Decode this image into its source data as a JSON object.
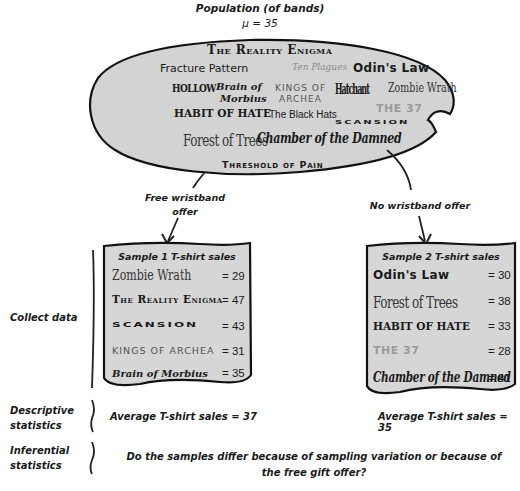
{
  "population": {
    "title": "Population (of bands)",
    "mean_label": "μ = 35",
    "bands": [
      "The Reality Enigma",
      "Fracture Pattern",
      "Ten Plagues",
      "Odin's Law",
      "HOLLOW",
      "Brain of",
      "Morbius",
      "KINGS OF",
      "ARCHEA",
      "Hatchant",
      "Zombie Wrath",
      "THE 37",
      "HABIT OF HATE",
      "The Black Hats",
      "SCANSION",
      "Forest of Trees",
      "Chamber of the Damned",
      "Threshold of Pain"
    ]
  },
  "branches": {
    "left_label": "Free wristband offer",
    "left_label_line1": "Free wristband",
    "left_label_line2": "offer",
    "right_label": "No wristband offer"
  },
  "samples": [
    {
      "title": "Sample 1 T-shirt sales",
      "rows": [
        {
          "band": "Zombie Wrath",
          "value": "= 29"
        },
        {
          "band": "The Reality Enigma",
          "value": "= 47"
        },
        {
          "band": "SCANSION",
          "value": "= 43"
        },
        {
          "band": "KINGS OF ARCHEA",
          "value": "= 31"
        },
        {
          "band": "Brain of Morbius",
          "value": "= 35"
        }
      ],
      "average": "Average T-shirt sales = 37"
    },
    {
      "title": "Sample 2 T-shirt sales",
      "rows": [
        {
          "band": "Odin's Law",
          "value": "= 30"
        },
        {
          "band": "Forest of Trees",
          "value": "= 38"
        },
        {
          "band": "HABIT OF HATE",
          "value": "= 33"
        },
        {
          "band": "THE 37",
          "value": "= 28"
        },
        {
          "band": "Chamber of the Damned",
          "value": "= 41"
        }
      ],
      "average": "Average T-shirt sales = 35"
    }
  ],
  "stages": {
    "collect": "Collect data",
    "descriptive_1": "Descriptive",
    "descriptive_2": "statistics",
    "inferential_1": "Inferential",
    "inferential_2": "statistics"
  },
  "question": {
    "line1": "Do the samples differ because of sampling variation or because of",
    "line2": "the free gift offer?"
  },
  "colors": {
    "bubble_fill": "#d3d3d3",
    "box_fill": "#d6d6d6",
    "outline": "#111111",
    "faded_text": "#9a9a9a"
  }
}
